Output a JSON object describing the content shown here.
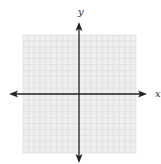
{
  "diagram": {
    "type": "coordinate-plane",
    "x_axis_label": "x",
    "y_axis_label": "y",
    "grid": {
      "columns": 20,
      "rows": 20,
      "left": 23,
      "top": 35,
      "right": 136,
      "bottom": 153,
      "line_color": "#d9d9d9",
      "background": "#efefef"
    },
    "axes": {
      "origin_x": 79,
      "origin_y": 94,
      "x_start": 9,
      "x_end": 147,
      "y_start": 22,
      "y_end": 163,
      "color": "#222222"
    },
    "labels": {
      "x_label_pos": [
        155,
        97
      ],
      "y_label_pos": [
        78,
        15
      ]
    }
  }
}
